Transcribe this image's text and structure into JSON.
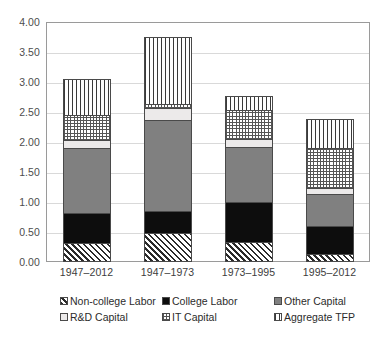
{
  "chart_data": {
    "type": "bar",
    "subtype": "stacked-column",
    "title": "",
    "subtitle": "",
    "xlabel": "",
    "ylabel": "",
    "ylim": [
      0,
      4.0
    ],
    "ytick_step": 0.5,
    "ytick_labels": [
      "0.00",
      "0.50",
      "1.00",
      "1.50",
      "2.00",
      "2.50",
      "3.00",
      "3.50",
      "4.00"
    ],
    "grid": true,
    "grid_axis": "y",
    "legend_position": "bottom",
    "categories": [
      "1947–2012",
      "1947–1973",
      "1973–1995",
      "1995–2012"
    ],
    "series": [
      {
        "name": "Non-college Labor",
        "pattern": "diagonal-hatch",
        "color": "#2b2b2b",
        "values": [
          0.32,
          0.48,
          0.33,
          0.13
        ]
      },
      {
        "name": "College Labor",
        "pattern": "solid-black",
        "color": "#0d0d0d",
        "values": [
          0.5,
          0.37,
          0.67,
          0.47
        ]
      },
      {
        "name": "Other Capital",
        "pattern": "solid-gray",
        "color": "#808080",
        "values": [
          1.08,
          1.51,
          0.92,
          0.53
        ]
      },
      {
        "name": "R&D Capital",
        "pattern": "solid-light",
        "color": "#eceaea",
        "values": [
          0.13,
          0.2,
          0.13,
          0.1
        ]
      },
      {
        "name": "IT Capital",
        "pattern": "cross-dots",
        "color": "#555555",
        "values": [
          0.42,
          0.08,
          0.48,
          0.67
        ]
      },
      {
        "name": "Aggregate TFP",
        "pattern": "vertical-lines",
        "color": "#3a3a3a",
        "values": [
          0.6,
          1.11,
          0.24,
          0.49
        ]
      }
    ],
    "totals": [
      3.05,
      3.75,
      2.77,
      2.39
    ]
  },
  "axes": {
    "y_ticks": [
      {
        "label": "4.00",
        "value": 4.0
      },
      {
        "label": "3.50",
        "value": 3.5
      },
      {
        "label": "3.00",
        "value": 3.0
      },
      {
        "label": "2.50",
        "value": 2.5
      },
      {
        "label": "2.00",
        "value": 2.0
      },
      {
        "label": "1.50",
        "value": 1.5
      },
      {
        "label": "1.00",
        "value": 1.0
      },
      {
        "label": "0.50",
        "value": 0.5
      },
      {
        "label": "0.00",
        "value": 0.0
      }
    ],
    "x_ticks": [
      {
        "label": "1947–2012"
      },
      {
        "label": "1947–1973"
      },
      {
        "label": "1973–1995"
      },
      {
        "label": "1995–2012"
      }
    ]
  },
  "legend": {
    "rows": [
      [
        {
          "label": "Non-college Labor",
          "pattern": "diagonal-hatch"
        },
        {
          "label": "College Labor",
          "pattern": "solid-black"
        },
        {
          "label": "Other Capital",
          "pattern": "solid-gray"
        }
      ],
      [
        {
          "label": "R&D Capital",
          "pattern": "solid-light"
        },
        {
          "label": "IT Capital",
          "pattern": "cross-dots"
        },
        {
          "label": "Aggregate TFP",
          "pattern": "vertical-lines"
        }
      ]
    ]
  },
  "colors": {
    "plot_border": "#9a9a9a",
    "gridline": "#d9d9d9",
    "tick_text": "#4d4d4d",
    "legend_text": "#2b2b2b",
    "background": "#ffffff"
  }
}
